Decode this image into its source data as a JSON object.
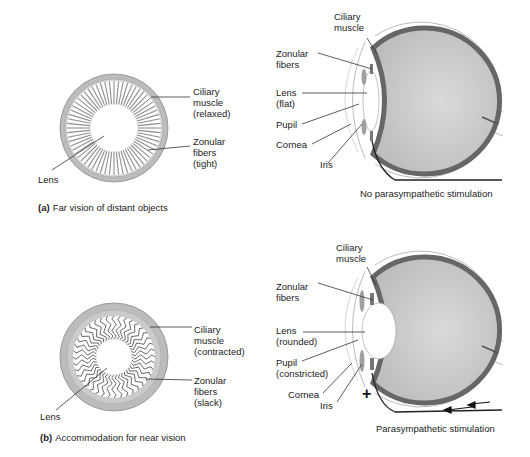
{
  "panel_a": {
    "caption_letter": "(a)",
    "caption_text": "Far vision of distant objects",
    "front_view": {
      "labels": {
        "ciliary_1": "Ciliary",
        "ciliary_2": "muscle",
        "ciliary_3": "(relaxed)",
        "zonular_1": "Zonular",
        "zonular_2": "fibers",
        "zonular_3": "(tight)",
        "lens": "Lens"
      }
    },
    "side_view": {
      "labels": {
        "ciliary_1": "Ciliary",
        "ciliary_2": "muscle",
        "zonular_1": "Zonular",
        "zonular_2": "fibers",
        "lens_1": "Lens",
        "lens_2": "(flat)",
        "pupil": "Pupil",
        "cornea": "Cornea",
        "iris": "Iris"
      },
      "stimulation": "No parasympathetic stimulation"
    }
  },
  "panel_b": {
    "caption_letter": "(b)",
    "caption_text": "Accommodation for near vision",
    "front_view": {
      "labels": {
        "ciliary_1": "Ciliary",
        "ciliary_2": "muscle",
        "ciliary_3": "(contracted)",
        "zonular_1": "Zonular",
        "zonular_2": "fibers",
        "zonular_3": "(slack)",
        "lens": "Lens"
      }
    },
    "side_view": {
      "labels": {
        "ciliary_1": "Ciliary",
        "ciliary_2": "muscle",
        "zonular_1": "Zonular",
        "zonular_2": "fibers",
        "lens_1": "Lens",
        "lens_2": "(rounded)",
        "pupil_1": "Pupil",
        "pupil_2": "(constricted)",
        "cornea": "Cornea",
        "iris": "Iris"
      },
      "plus_sign": "+",
      "stimulation": "Parasympathetic stimulation"
    }
  },
  "colors": {
    "sclera_dark": "#6b6b6b",
    "eyeball_fill": "#c8c8c8",
    "ring_gray": "#b5b5b5",
    "line": "#333333"
  }
}
